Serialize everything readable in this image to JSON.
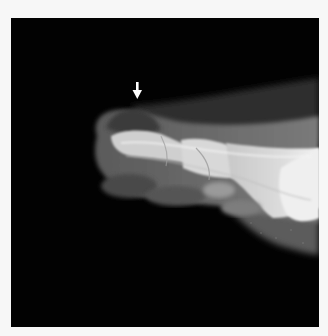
{
  "image": {
    "type": "radiograph",
    "subject": "lateral foot / toes X-ray",
    "annotation": {
      "type": "arrow",
      "direction": "down",
      "color": "#ffffff"
    },
    "colors": {
      "background": "#f7f7f7",
      "film": "#020202",
      "soft_tissue": "#6e6e6e",
      "bone": "#e6e6e6"
    }
  }
}
